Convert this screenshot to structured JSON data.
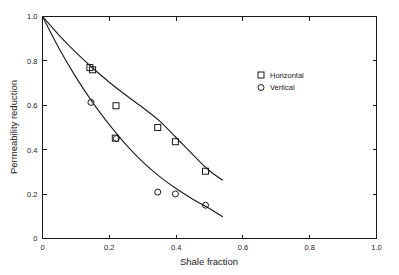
{
  "chart_data": {
    "type": "scatter",
    "title": "",
    "xlabel": "Shale fraction",
    "ylabel": "Permeability reduction",
    "xlim": [
      0,
      1.0
    ],
    "ylim": [
      0,
      1.0
    ],
    "grid": false,
    "legend_position": "upper-right-inside",
    "xticks": [
      "0",
      "0.2",
      "0.4",
      "0.6",
      "0.8",
      "1.0"
    ],
    "xtick_values": [
      0,
      0.2,
      0.4,
      0.6,
      0.8,
      1.0
    ],
    "yticks": [
      "0",
      "0.2",
      "0.4",
      "0.6",
      "0.8",
      "1.0"
    ],
    "ytick_values": [
      0,
      0.2,
      0.4,
      0.6,
      0.8,
      1.0
    ],
    "series": [
      {
        "name": "Horizontal",
        "marker": "square",
        "points": [
          {
            "x": 0.142,
            "y": 0.77
          },
          {
            "x": 0.15,
            "y": 0.76
          },
          {
            "x": 0.22,
            "y": 0.598
          },
          {
            "x": 0.218,
            "y": 0.452
          },
          {
            "x": 0.345,
            "y": 0.5
          },
          {
            "x": 0.398,
            "y": 0.436
          },
          {
            "x": 0.488,
            "y": 0.303
          }
        ],
        "fit_curve": [
          {
            "x": 0.0,
            "y": 1.0
          },
          {
            "x": 0.05,
            "y": 0.915
          },
          {
            "x": 0.1,
            "y": 0.838
          },
          {
            "x": 0.15,
            "y": 0.768
          },
          {
            "x": 0.2,
            "y": 0.704
          },
          {
            "x": 0.25,
            "y": 0.645
          },
          {
            "x": 0.3,
            "y": 0.59
          },
          {
            "x": 0.35,
            "y": 0.53
          },
          {
            "x": 0.4,
            "y": 0.455
          },
          {
            "x": 0.45,
            "y": 0.378
          },
          {
            "x": 0.5,
            "y": 0.305
          },
          {
            "x": 0.54,
            "y": 0.262
          }
        ]
      },
      {
        "name": "Vertical",
        "marker": "circle",
        "points": [
          {
            "x": 0.145,
            "y": 0.613
          },
          {
            "x": 0.221,
            "y": 0.45
          },
          {
            "x": 0.345,
            "y": 0.209
          },
          {
            "x": 0.398,
            "y": 0.201
          },
          {
            "x": 0.488,
            "y": 0.15
          }
        ],
        "fit_curve": [
          {
            "x": 0.0,
            "y": 1.0
          },
          {
            "x": 0.05,
            "y": 0.855
          },
          {
            "x": 0.1,
            "y": 0.727
          },
          {
            "x": 0.15,
            "y": 0.613
          },
          {
            "x": 0.2,
            "y": 0.513
          },
          {
            "x": 0.25,
            "y": 0.423
          },
          {
            "x": 0.3,
            "y": 0.345
          },
          {
            "x": 0.35,
            "y": 0.28
          },
          {
            "x": 0.4,
            "y": 0.225
          },
          {
            "x": 0.45,
            "y": 0.177
          },
          {
            "x": 0.5,
            "y": 0.135
          },
          {
            "x": 0.54,
            "y": 0.098
          }
        ]
      }
    ]
  },
  "legend": {
    "entries": [
      {
        "label": "Horizontal",
        "marker": "square"
      },
      {
        "label": "Vertical",
        "marker": "circle"
      }
    ]
  },
  "axes": {
    "x_title": "Shale fraction",
    "y_title": "Permeability reduction"
  },
  "colors": {
    "ink": "#1a1a1a",
    "background": "#ffffff"
  }
}
